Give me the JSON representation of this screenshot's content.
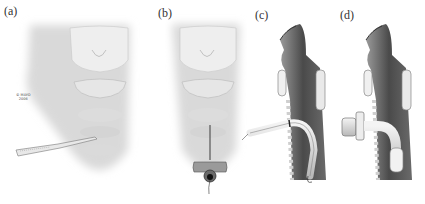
{
  "figure": {
    "panels": [
      {
        "label": "(a)",
        "description": "Neck skin incision with scalpel below the cricoid cartilage"
      },
      {
        "label": "(b)",
        "description": "Needle/introducer inserted into the trachea with guidewire"
      },
      {
        "label": "(c)",
        "description": "Sagittal view: dilator/tube advanced over guidewire into trachea"
      },
      {
        "label": "(d)",
        "description": "Sagittal view: tracheostomy tube with cuff in place"
      }
    ],
    "watermark": {
      "line1": "© MAYO",
      "line2": "2006"
    }
  }
}
